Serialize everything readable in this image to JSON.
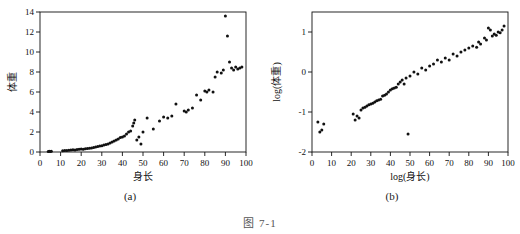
{
  "figure": {
    "bottom_label": "图 7-1",
    "panel_a_caption": "(a)",
    "panel_b_caption": "(b)"
  },
  "chart_data": [
    {
      "type": "scatter",
      "title": "",
      "panel": "(a)",
      "xlabel": "身长",
      "ylabel": "体重",
      "xlim": [
        0,
        100
      ],
      "ylim": [
        0,
        14
      ],
      "xticks": [
        0,
        10,
        20,
        30,
        40,
        50,
        60,
        70,
        80,
        90,
        100
      ],
      "yticks": [
        0,
        2,
        4,
        6,
        8,
        10,
        12,
        14
      ],
      "grid": false,
      "points": [
        [
          4.0,
          0.06
        ],
        [
          4.5,
          0.07
        ],
        [
          5.0,
          0.05
        ],
        [
          5.5,
          0.08
        ],
        [
          11.0,
          0.12
        ],
        [
          12.0,
          0.15
        ],
        [
          13.0,
          0.14
        ],
        [
          14.0,
          0.18
        ],
        [
          15.0,
          0.2
        ],
        [
          16.0,
          0.22
        ],
        [
          17.0,
          0.2
        ],
        [
          18.0,
          0.25
        ],
        [
          19.0,
          0.27
        ],
        [
          20.0,
          0.3
        ],
        [
          21.0,
          0.28
        ],
        [
          22.0,
          0.33
        ],
        [
          23.0,
          0.35
        ],
        [
          24.0,
          0.38
        ],
        [
          25.0,
          0.4
        ],
        [
          26.0,
          0.45
        ],
        [
          27.0,
          0.5
        ],
        [
          28.0,
          0.55
        ],
        [
          29.0,
          0.6
        ],
        [
          30.0,
          0.62
        ],
        [
          31.0,
          0.7
        ],
        [
          32.0,
          0.75
        ],
        [
          33.0,
          0.8
        ],
        [
          34.0,
          0.9
        ],
        [
          35.0,
          1.0
        ],
        [
          36.0,
          1.1
        ],
        [
          37.0,
          1.2
        ],
        [
          38.0,
          1.3
        ],
        [
          39.0,
          1.45
        ],
        [
          40.0,
          1.5
        ],
        [
          41.0,
          1.6
        ],
        [
          42.0,
          1.8
        ],
        [
          43.0,
          2.0
        ],
        [
          44.0,
          2.1
        ],
        [
          45.0,
          2.6
        ],
        [
          45.5,
          2.9
        ],
        [
          46.0,
          3.2
        ],
        [
          47.0,
          1.2
        ],
        [
          48.0,
          1.5
        ],
        [
          49.0,
          0.8
        ],
        [
          50.0,
          2.0
        ],
        [
          52.0,
          3.4
        ],
        [
          55.0,
          2.3
        ],
        [
          58.0,
          3.1
        ],
        [
          60.0,
          3.5
        ],
        [
          62.0,
          3.4
        ],
        [
          64.0,
          3.6
        ],
        [
          66.0,
          4.8
        ],
        [
          70.0,
          4.1
        ],
        [
          71.0,
          4.0
        ],
        [
          72.0,
          4.2
        ],
        [
          74.0,
          4.4
        ],
        [
          76.0,
          5.7
        ],
        [
          78.0,
          5.2
        ],
        [
          80.0,
          6.1
        ],
        [
          81.0,
          6.0
        ],
        [
          82.0,
          6.2
        ],
        [
          84.0,
          6.0
        ],
        [
          85.0,
          7.5
        ],
        [
          86.0,
          8.0
        ],
        [
          88.0,
          7.9
        ],
        [
          89.0,
          8.2
        ],
        [
          90.0,
          13.6
        ],
        [
          91.0,
          11.6
        ],
        [
          92.0,
          9.0
        ],
        [
          93.0,
          8.4
        ],
        [
          94.0,
          8.2
        ],
        [
          95.0,
          8.5
        ],
        [
          96.0,
          8.3
        ],
        [
          97.0,
          8.4
        ],
        [
          98.0,
          8.5
        ]
      ]
    },
    {
      "type": "scatter",
      "title": "",
      "panel": "(b)",
      "xlabel": "log(身长)",
      "ylabel": "log(体重)",
      "xlim": [
        0,
        100
      ],
      "ylim": [
        -2,
        1.5
      ],
      "xticks": [
        0,
        10,
        20,
        30,
        40,
        50,
        60,
        70,
        80,
        90,
        100
      ],
      "yticks": [
        -2,
        -1,
        0,
        1
      ],
      "grid": false,
      "points": [
        [
          3.0,
          -1.25
        ],
        [
          4.0,
          -1.5
        ],
        [
          5.0,
          -1.45
        ],
        [
          6.0,
          -1.3
        ],
        [
          21.0,
          -1.05
        ],
        [
          22.0,
          -1.2
        ],
        [
          23.0,
          -1.1
        ],
        [
          24.0,
          -1.15
        ],
        [
          25.0,
          -0.95
        ],
        [
          26.0,
          -0.9
        ],
        [
          27.0,
          -0.88
        ],
        [
          28.0,
          -0.85
        ],
        [
          29.0,
          -0.82
        ],
        [
          30.0,
          -0.8
        ],
        [
          31.0,
          -0.78
        ],
        [
          32.0,
          -0.75
        ],
        [
          33.0,
          -0.72
        ],
        [
          34.0,
          -0.7
        ],
        [
          35.0,
          -0.68
        ],
        [
          36.0,
          -0.6
        ],
        [
          37.0,
          -0.58
        ],
        [
          38.0,
          -0.55
        ],
        [
          39.0,
          -0.5
        ],
        [
          40.0,
          -0.45
        ],
        [
          41.0,
          -0.42
        ],
        [
          42.0,
          -0.4
        ],
        [
          43.0,
          -0.38
        ],
        [
          44.0,
          -0.3
        ],
        [
          45.0,
          -0.25
        ],
        [
          46.0,
          -0.2
        ],
        [
          47.0,
          -0.3
        ],
        [
          48.0,
          -0.15
        ],
        [
          49.0,
          -1.55
        ],
        [
          50.0,
          -0.1
        ],
        [
          52.0,
          0.0
        ],
        [
          54.0,
          -0.05
        ],
        [
          56.0,
          0.1
        ],
        [
          58.0,
          0.05
        ],
        [
          60.0,
          0.15
        ],
        [
          62.0,
          0.2
        ],
        [
          64.0,
          0.3
        ],
        [
          66.0,
          0.25
        ],
        [
          68.0,
          0.35
        ],
        [
          70.0,
          0.3
        ],
        [
          72.0,
          0.45
        ],
        [
          74.0,
          0.4
        ],
        [
          76.0,
          0.5
        ],
        [
          78.0,
          0.55
        ],
        [
          80.0,
          0.6
        ],
        [
          82.0,
          0.65
        ],
        [
          84.0,
          0.62
        ],
        [
          85.0,
          0.75
        ],
        [
          86.0,
          0.7
        ],
        [
          88.0,
          0.85
        ],
        [
          89.0,
          0.8
        ],
        [
          90.0,
          1.1
        ],
        [
          91.0,
          1.05
        ],
        [
          92.0,
          0.9
        ],
        [
          93.0,
          0.95
        ],
        [
          94.0,
          0.92
        ],
        [
          95.0,
          1.0
        ],
        [
          96.0,
          0.98
        ],
        [
          97.0,
          1.05
        ],
        [
          98.0,
          1.15
        ]
      ]
    }
  ]
}
